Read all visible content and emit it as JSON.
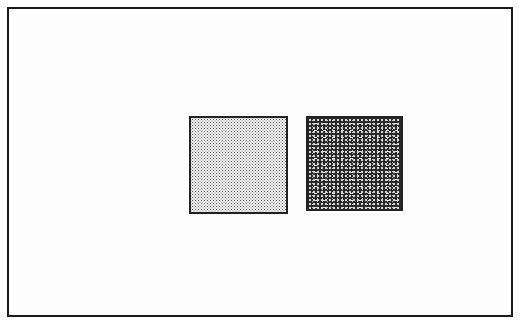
{
  "canvas": {
    "background": "#ffffff",
    "frame_border_color": "#1a1a1a"
  },
  "stimuli": [
    {
      "id": "light-square",
      "texture": "light-stipple",
      "fill": "#d9d9d9"
    },
    {
      "id": "dark-square",
      "texture": "dark-mottled",
      "fill": "#333333"
    }
  ]
}
